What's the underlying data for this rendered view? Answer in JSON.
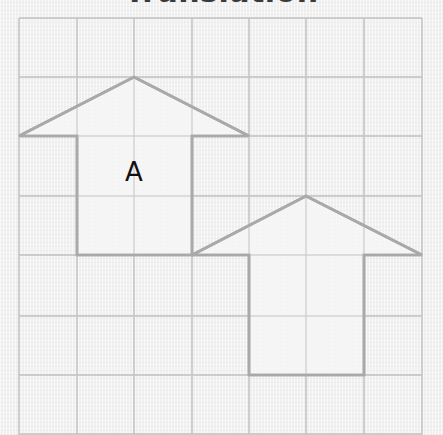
{
  "title": "Translation",
  "grid": {
    "columns_x": [
      19,
      77,
      134,
      192,
      249,
      306,
      364,
      422
    ],
    "rows_y": [
      18,
      77,
      136,
      196,
      255,
      316,
      375,
      434
    ],
    "line_color": "#c6c6c6",
    "background_color": "#f1f1f1"
  },
  "shapes": [
    {
      "id": "A",
      "label": "A",
      "description": "House-shaped pentagon (original)",
      "grid_points": [
        [
          0,
          2
        ],
        [
          2,
          1
        ],
        [
          4,
          2
        ],
        [
          3,
          2
        ],
        [
          3,
          4
        ],
        [
          1,
          4
        ],
        [
          1,
          2
        ]
      ],
      "label_position": [
        134,
        181
      ],
      "stroke": "#a9a9a9",
      "fill": "#f6f6f6"
    },
    {
      "id": "B",
      "label": "",
      "description": "Translated image of A (3 right, 2 down)",
      "grid_points": [
        [
          3,
          4
        ],
        [
          5,
          3
        ],
        [
          7,
          4
        ],
        [
          6,
          4
        ],
        [
          6,
          6
        ],
        [
          4,
          6
        ],
        [
          4,
          4
        ]
      ],
      "stroke": "#a9a9a9",
      "fill": "#f6f6f6"
    }
  ],
  "translation": {
    "right": 3,
    "down": 2
  }
}
